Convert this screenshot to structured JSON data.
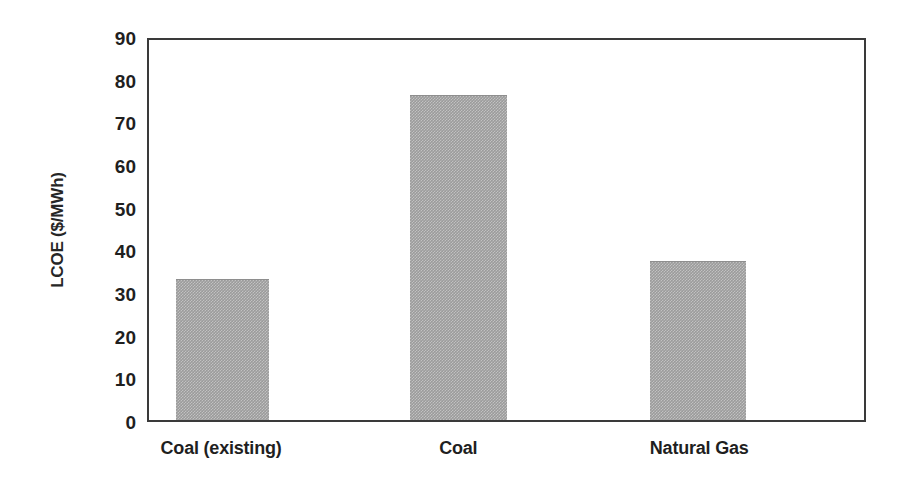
{
  "chart_data": {
    "type": "bar",
    "title": "",
    "subtitle": "",
    "xlabel": "",
    "ylabel": "LCOE ($/MWh)",
    "categories": [
      "Coal (existing)",
      "Coal",
      "Natural Gas"
    ],
    "values": [
      33.4,
      76.9,
      37.7
    ],
    "series": [
      {
        "name": "LCOE",
        "values": [
          33.4,
          76.9,
          37.7
        ]
      }
    ],
    "ylim": [
      0,
      90
    ],
    "xlim": [
      0,
      3
    ],
    "ytick_labels": [
      "90",
      "80",
      "70",
      "60",
      "50",
      "40",
      "30",
      "20",
      "10",
      "0"
    ],
    "ytick_values": [
      90,
      80,
      70,
      60,
      50,
      40,
      30,
      20,
      10,
      0
    ],
    "ytick_interval": 10,
    "grid": false,
    "legend": false,
    "legend_position": "none",
    "annotations": [],
    "colors": {
      "bar_fill": "#9b9b9b",
      "axis_line": "#3a3a3a",
      "text": "#1f1f1f",
      "background": "#ffffff"
    },
    "bar_geometry": [
      {
        "category": "Coal (existing)",
        "center_pct": 10.3,
        "width_pct": 13.1
      },
      {
        "category": "Coal",
        "center_pct": 43.3,
        "width_pct": 13.5
      },
      {
        "category": "Natural Gas",
        "center_pct": 76.8,
        "width_pct": 13.4
      }
    ]
  }
}
